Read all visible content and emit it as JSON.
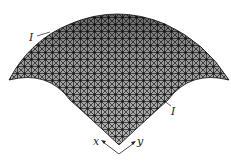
{
  "figure": {
    "type": "triangulated mesh dome surface",
    "labels": {
      "edge_label_top": "I",
      "edge_label_right": "I",
      "axis_x": "x",
      "axis_y": "y"
    },
    "colors": {
      "mesh_line": "#1a1a1a",
      "background": "#ffffff"
    }
  }
}
